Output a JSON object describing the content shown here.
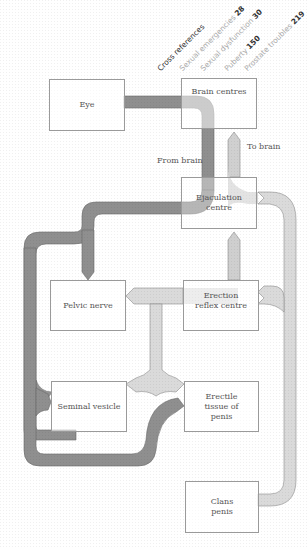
{
  "cross_references": {
    "title": "Cross references",
    "items": [
      {
        "label": "Sexual emergencies",
        "page": "28"
      },
      {
        "label": "Sexual dysfunction",
        "page": "30"
      },
      {
        "label": "Puberty",
        "page": "150"
      },
      {
        "label": "Prostate troubles",
        "page": "219"
      }
    ]
  },
  "boxes": {
    "eye": "Eye",
    "brain_centres": "Brain centres",
    "ejaculation_centre": "Ejaculation centre",
    "pelvic_nerve": "Pelvic nerve",
    "erection_reflex_centre": "Erection reflex centre",
    "seminal_vesicle": "Seminal vesicle",
    "erectile_tissue": "Erectile tissue of penis",
    "glans_penis": "Clans penis"
  },
  "labels": {
    "from_brain": "From brain",
    "to_brain": "To brain"
  },
  "colors": {
    "dark_pathway": "#8a8a8a",
    "light_pathway": "#d8d8d8",
    "box_border": "#9a9a9a",
    "text": "#555555"
  }
}
